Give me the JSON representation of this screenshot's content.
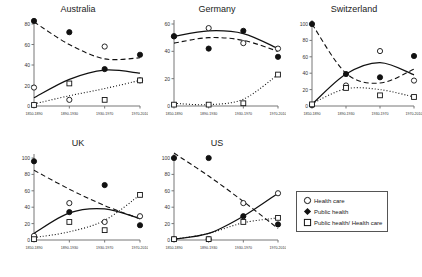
{
  "chart_data": {
    "type": "scatter",
    "title": "",
    "xlabel": "",
    "ylabel": "",
    "categories": [
      "1850-1890",
      "1890-1930",
      "1930-1970",
      "1970-2010"
    ],
    "legend": {
      "position": "bottom-right",
      "entries": [
        {
          "label": "Health care",
          "marker": "open-circle",
          "line": "solid"
        },
        {
          "label": "Public health",
          "marker": "filled-diamond",
          "line": "dashed"
        },
        {
          "label": "Public health/ Health care",
          "marker": "open-square",
          "line": "dotted"
        }
      ]
    },
    "panels": [
      {
        "title": "Australia",
        "ylim": [
          0,
          80
        ],
        "yticks": [
          0,
          20,
          40,
          60,
          80
        ],
        "series": [
          {
            "name": "Health care",
            "values": [
              18,
              6,
              58,
              25
            ]
          },
          {
            "name": "Public health",
            "values": [
              83,
              72,
              36,
              50
            ]
          },
          {
            "name": "Public health/ Health care",
            "values": [
              1,
              22,
              6,
              25
            ]
          }
        ],
        "fits": [
          {
            "name": "Health care",
            "curve": [
              8,
              26,
              35,
              32
            ]
          },
          {
            "name": "Public health",
            "curve": [
              82,
              60,
              46,
              47
            ]
          },
          {
            "name": "Public health/ Health care",
            "curve": [
              2,
              10,
              17,
              25
            ]
          }
        ]
      },
      {
        "title": "Germany",
        "ylim": [
          0,
          60
        ],
        "yticks": [
          0,
          20,
          40,
          60
        ],
        "series": [
          {
            "name": "Health care",
            "values": [
              51,
              57,
              46,
              42
            ]
          },
          {
            "name": "Public health",
            "values": [
              51,
              42,
              55,
              36
            ]
          },
          {
            "name": "Public health/ Health care",
            "values": [
              1,
              1,
              2,
              23
            ]
          }
        ],
        "fits": [
          {
            "name": "Health care",
            "curve": [
              51,
              55,
              53,
              42
            ]
          },
          {
            "name": "Public health",
            "curve": [
              46,
              50,
              48,
              40
            ]
          },
          {
            "name": "Public health/ Health care",
            "curve": [
              2,
              1,
              5,
              23
            ]
          }
        ]
      },
      {
        "title": "Switzerland",
        "ylim": [
          0,
          100
        ],
        "yticks": [
          0,
          20,
          40,
          60,
          80,
          100
        ],
        "series": [
          {
            "name": "Health care",
            "values": [
              1,
              25,
              67,
              31
            ]
          },
          {
            "name": "Public health",
            "values": [
              100,
              39,
              35,
              61
            ]
          },
          {
            "name": "Public health/ Health care",
            "values": [
              2,
              22,
              13,
              11
            ]
          }
        ],
        "fits": [
          {
            "name": "Health care",
            "curve": [
              2,
              39,
              53,
              38
            ]
          },
          {
            "name": "Public health",
            "curve": [
              100,
              40,
              28,
              45
            ]
          },
          {
            "name": "Public health/ Health care",
            "curve": [
              3,
              21,
              20,
              11
            ]
          }
        ]
      },
      {
        "title": "UK",
        "ylim": [
          0,
          100
        ],
        "yticks": [
          0,
          20,
          40,
          60,
          80,
          100
        ],
        "series": [
          {
            "name": "Health care",
            "values": [
              5,
              45,
              22,
              29
            ]
          },
          {
            "name": "Public health",
            "values": [
              96,
              34,
              67,
              18
            ]
          },
          {
            "name": "Public health/ Health care",
            "values": [
              1,
              22,
              12,
              55
            ]
          }
        ],
        "fits": [
          {
            "name": "Health care",
            "curve": [
              8,
              33,
              38,
              26
            ]
          },
          {
            "name": "Public health",
            "curve": [
              85,
              62,
              42,
              26
            ]
          },
          {
            "name": "Public health/ Health care",
            "curve": [
              3,
              10,
              24,
              55
            ]
          }
        ]
      },
      {
        "title": "US",
        "ylim": [
          0,
          100
        ],
        "yticks": [
          0,
          20,
          40,
          60,
          80,
          100
        ],
        "series": [
          {
            "name": "Health care",
            "values": [
              1,
              1,
              45,
              57
            ]
          },
          {
            "name": "Public health",
            "values": [
              100,
              100,
              29,
              19
            ]
          },
          {
            "name": "Public health/ Health care",
            "values": [
              1,
              1,
              22,
              27
            ]
          }
        ],
        "fits": [
          {
            "name": "Health care",
            "curve": [
              1,
              8,
              29,
              57
            ]
          },
          {
            "name": "Public health",
            "curve": [
              106,
              78,
              47,
              14
            ]
          },
          {
            "name": "Public health/ Health care",
            "curve": [
              1,
              8,
              21,
              27
            ]
          }
        ]
      }
    ]
  }
}
